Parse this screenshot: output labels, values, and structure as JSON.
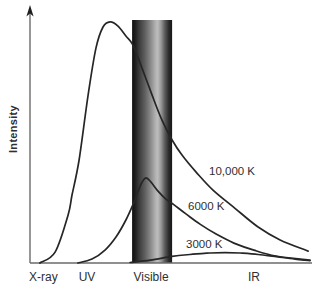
{
  "figure": {
    "y_axis_label": "Intensity",
    "x_axis_labels": {
      "xray": "X-ray",
      "uv": "UV",
      "visible": "Visible",
      "ir": "IR"
    },
    "curve_labels": {
      "t10000": "10,000 K",
      "t6000": "6000 K",
      "t3000": "3000 K"
    },
    "colors": {
      "background": "#ffffff",
      "curve": "#262626",
      "axis": "#6b6b6b",
      "arrow": "#1e1e1e",
      "text": "#2f2f2f"
    },
    "band_gradient": [
      {
        "offset": 0,
        "color": "#0f0f0f"
      },
      {
        "offset": 0.07,
        "color": "#1c1c1c"
      },
      {
        "offset": 0.18,
        "color": "#3c3c3c"
      },
      {
        "offset": 0.32,
        "color": "#5f5f5f"
      },
      {
        "offset": 0.45,
        "color": "#868686"
      },
      {
        "offset": 0.58,
        "color": "#b0b0b0"
      },
      {
        "offset": 0.64,
        "color": "#bdbdbd"
      },
      {
        "offset": 0.72,
        "color": "#9a9a9a"
      },
      {
        "offset": 0.82,
        "color": "#5a5a5a"
      },
      {
        "offset": 0.92,
        "color": "#2a2a2a"
      },
      {
        "offset": 1,
        "color": "#161616"
      }
    ]
  },
  "chart_data": {
    "type": "line",
    "title": "",
    "xlabel": "",
    "ylabel": "Intensity",
    "x_axis_regions": [
      "X-ray",
      "UV",
      "Visible",
      "IR"
    ],
    "x_units": "fraction of x-axis (wavelength increasing rightward, unlabeled qualitative scale)",
    "y_units": "fraction of full intensity scale (unlabeled qualitative scale)",
    "grid": false,
    "legend": "inline labels beside each curve",
    "visible_band_x_frac": [
      0.362,
      0.504
    ],
    "series": [
      {
        "name": "10,000 K",
        "points": [
          [
            0.035,
            0.0
          ],
          [
            0.089,
            0.045
          ],
          [
            0.135,
            0.198
          ],
          [
            0.149,
            0.28
          ],
          [
            0.174,
            0.424
          ],
          [
            0.206,
            0.691
          ],
          [
            0.234,
            0.885
          ],
          [
            0.259,
            0.971
          ],
          [
            0.284,
            0.992
          ],
          [
            0.312,
            0.975
          ],
          [
            0.34,
            0.934
          ],
          [
            0.365,
            0.897
          ],
          [
            0.397,
            0.802
          ],
          [
            0.433,
            0.691
          ],
          [
            0.468,
            0.588
          ],
          [
            0.504,
            0.506
          ],
          [
            0.539,
            0.444
          ],
          [
            0.589,
            0.374
          ],
          [
            0.649,
            0.3
          ],
          [
            0.727,
            0.225
          ],
          [
            0.809,
            0.148
          ],
          [
            0.887,
            0.095
          ],
          [
            0.986,
            0.049
          ]
        ]
      },
      {
        "name": "6000 K",
        "points": [
          [
            0.17,
            0.0
          ],
          [
            0.22,
            0.016
          ],
          [
            0.266,
            0.053
          ],
          [
            0.305,
            0.107
          ],
          [
            0.34,
            0.177
          ],
          [
            0.369,
            0.251
          ],
          [
            0.394,
            0.325
          ],
          [
            0.411,
            0.35
          ],
          [
            0.429,
            0.333
          ],
          [
            0.454,
            0.296
          ],
          [
            0.482,
            0.263
          ],
          [
            0.511,
            0.239
          ],
          [
            0.553,
            0.202
          ],
          [
            0.603,
            0.16
          ],
          [
            0.66,
            0.119
          ],
          [
            0.723,
            0.082
          ],
          [
            0.794,
            0.053
          ],
          [
            0.872,
            0.029
          ],
          [
            0.993,
            0.012
          ]
        ]
      },
      {
        "name": "3000 K",
        "points": [
          [
            0.355,
            0.002
          ],
          [
            0.426,
            0.012
          ],
          [
            0.504,
            0.027
          ],
          [
            0.567,
            0.035
          ],
          [
            0.638,
            0.041
          ],
          [
            0.691,
            0.043
          ],
          [
            0.745,
            0.041
          ],
          [
            0.809,
            0.035
          ],
          [
            0.879,
            0.025
          ],
          [
            0.94,
            0.016
          ],
          [
            0.993,
            0.01
          ]
        ]
      }
    ]
  }
}
